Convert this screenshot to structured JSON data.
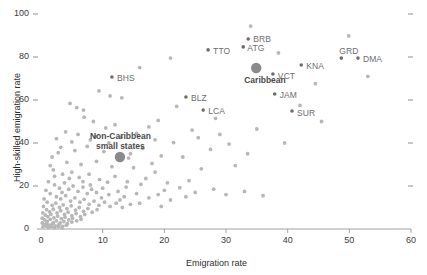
{
  "chart_data": {
    "type": "scatter",
    "title": "",
    "xlabel": "Emigration rate",
    "ylabel": "High-skilled emigration rate",
    "xlim": [
      0,
      60
    ],
    "ylim": [
      0,
      100
    ],
    "xticks": [
      0,
      10,
      20,
      30,
      40,
      50,
      60
    ],
    "yticks": [
      0,
      20,
      40,
      60,
      80,
      100
    ],
    "grid": false,
    "legend": "none",
    "colors": {
      "background_points": "#b7b7b7",
      "labeled_points": "#6d6d6d",
      "aggregate_markers": "#8a8a8a",
      "axis": "#a0a0a0",
      "text": "#4a4a4a"
    },
    "series": [
      {
        "name": "Labeled Caribbean countries",
        "marker": "small-dark",
        "points": [
          {
            "label": "BHS",
            "x": 11.5,
            "y": 70.7,
            "label_dx": 5,
            "label_dy": -4
          },
          {
            "label": "TTO",
            "x": 27.1,
            "y": 83.3,
            "label_dx": 5,
            "label_dy": -4
          },
          {
            "label": "BRB",
            "x": 33.6,
            "y": 88.4,
            "label_dx": 5,
            "label_dy": -5
          },
          {
            "label": "ATG",
            "x": 32.8,
            "y": 84.7,
            "label_dx": 4,
            "label_dy": -4
          },
          {
            "label": "BLZ",
            "x": 23.5,
            "y": 61.4,
            "label_dx": 5,
            "label_dy": -4
          },
          {
            "label": "LCA",
            "x": 26.3,
            "y": 55.3,
            "label_dx": 5,
            "label_dy": -4
          },
          {
            "label": "VCT",
            "x": 37.6,
            "y": 72.1,
            "label_dx": 5,
            "label_dy": -3
          },
          {
            "label": "KNA",
            "x": 42.2,
            "y": 76.3,
            "label_dx": 5,
            "label_dy": -4
          },
          {
            "label": "JAM",
            "x": 37.9,
            "y": 62.8,
            "label_dx": 5,
            "label_dy": -4
          },
          {
            "label": "SUR",
            "x": 40.7,
            "y": 54.9,
            "label_dx": 5,
            "label_dy": -3
          },
          {
            "label": "GRD",
            "x": 48.7,
            "y": 79.5,
            "label_dx": -2,
            "label_dy": -12
          },
          {
            "label": "DMA",
            "x": 51.4,
            "y": 79.5,
            "label_dx": 5,
            "label_dy": -4
          }
        ]
      },
      {
        "name": "Aggregate markers",
        "marker": "large",
        "points": [
          {
            "label": "Caribbean",
            "x": 34.9,
            "y": 74.9,
            "label_dx": -12,
            "label_dy": 7
          },
          {
            "label": "Non-Caribbean small states",
            "x": 12.8,
            "y": 33.5,
            "label_dx": -30,
            "label_dy": -26
          }
        ]
      },
      {
        "name": "Other countries",
        "marker": "small-light",
        "points": [
          {
            "x": 34.0,
            "y": 94.4
          },
          {
            "x": 49.9,
            "y": 89.8
          },
          {
            "x": 21.0,
            "y": 79.5
          },
          {
            "x": 38.5,
            "y": 81.9
          },
          {
            "x": 9.4,
            "y": 64.2
          },
          {
            "x": 16.0,
            "y": 75.1
          },
          {
            "x": 11.2,
            "y": 61.9
          },
          {
            "x": 13.1,
            "y": 61.0
          },
          {
            "x": 53.0,
            "y": 71.0
          },
          {
            "x": 4.7,
            "y": 58.4
          },
          {
            "x": 5.8,
            "y": 56.5
          },
          {
            "x": 6.9,
            "y": 55.3
          },
          {
            "x": 22.0,
            "y": 57.0
          },
          {
            "x": 28.3,
            "y": 51.5
          },
          {
            "x": 44.5,
            "y": 67.6
          },
          {
            "x": 8.5,
            "y": 50.0
          },
          {
            "x": 4.0,
            "y": 45.2
          },
          {
            "x": 10.5,
            "y": 47.0
          },
          {
            "x": 17.5,
            "y": 47.5
          },
          {
            "x": 2.5,
            "y": 42.0
          },
          {
            "x": 6.0,
            "y": 44.0
          },
          {
            "x": 8.8,
            "y": 43.0
          },
          {
            "x": 13.0,
            "y": 42.6
          },
          {
            "x": 18.5,
            "y": 41.5
          },
          {
            "x": 21.5,
            "y": 40.2
          },
          {
            "x": 25.5,
            "y": 42.5
          },
          {
            "x": 30.5,
            "y": 39.5
          },
          {
            "x": 3.2,
            "y": 38.0
          },
          {
            "x": 5.5,
            "y": 36.5
          },
          {
            "x": 7.5,
            "y": 38.4
          },
          {
            "x": 10.2,
            "y": 36.0
          },
          {
            "x": 14.5,
            "y": 35.0
          },
          {
            "x": 16.5,
            "y": 37.5
          },
          {
            "x": 19.5,
            "y": 34.0
          },
          {
            "x": 23.0,
            "y": 33.5
          },
          {
            "x": 1.8,
            "y": 33.5
          },
          {
            "x": 4.2,
            "y": 31.0
          },
          {
            "x": 6.5,
            "y": 30.0
          },
          {
            "x": 9.0,
            "y": 31.5
          },
          {
            "x": 11.5,
            "y": 29.0
          },
          {
            "x": 15.0,
            "y": 28.5
          },
          {
            "x": 18.0,
            "y": 30.5
          },
          {
            "x": 26.0,
            "y": 28.0
          },
          {
            "x": 31.5,
            "y": 29.5
          },
          {
            "x": 2.0,
            "y": 27.5
          },
          {
            "x": 3.5,
            "y": 25.5
          },
          {
            "x": 5.0,
            "y": 26.5
          },
          {
            "x": 6.2,
            "y": 24.0
          },
          {
            "x": 7.8,
            "y": 25.5
          },
          {
            "x": 9.5,
            "y": 23.0
          },
          {
            "x": 12.0,
            "y": 24.5
          },
          {
            "x": 14.0,
            "y": 22.0
          },
          {
            "x": 17.0,
            "y": 23.5
          },
          {
            "x": 20.5,
            "y": 21.5
          },
          {
            "x": 24.0,
            "y": 22.5
          },
          {
            "x": 1.2,
            "y": 22.0
          },
          {
            "x": 2.2,
            "y": 20.5
          },
          {
            "x": 3.0,
            "y": 19.0
          },
          {
            "x": 3.8,
            "y": 21.5
          },
          {
            "x": 4.5,
            "y": 18.5
          },
          {
            "x": 5.2,
            "y": 20.0
          },
          {
            "x": 6.0,
            "y": 17.5
          },
          {
            "x": 6.8,
            "y": 19.5
          },
          {
            "x": 7.5,
            "y": 16.5
          },
          {
            "x": 8.2,
            "y": 18.5
          },
          {
            "x": 9.0,
            "y": 17.0
          },
          {
            "x": 10.0,
            "y": 19.0
          },
          {
            "x": 11.0,
            "y": 16.0
          },
          {
            "x": 12.5,
            "y": 17.5
          },
          {
            "x": 13.5,
            "y": 15.0
          },
          {
            "x": 15.5,
            "y": 16.5
          },
          {
            "x": 17.5,
            "y": 14.5
          },
          {
            "x": 19.0,
            "y": 16.0
          },
          {
            "x": 21.0,
            "y": 13.5
          },
          {
            "x": 23.5,
            "y": 15.0
          },
          {
            "x": 0.8,
            "y": 18.0
          },
          {
            "x": 1.5,
            "y": 16.5
          },
          {
            "x": 2.5,
            "y": 15.0
          },
          {
            "x": 3.2,
            "y": 14.0
          },
          {
            "x": 4.0,
            "y": 15.5
          },
          {
            "x": 4.8,
            "y": 13.0
          },
          {
            "x": 5.5,
            "y": 14.5
          },
          {
            "x": 6.3,
            "y": 12.5
          },
          {
            "x": 7.0,
            "y": 13.8
          },
          {
            "x": 7.8,
            "y": 11.5
          },
          {
            "x": 8.6,
            "y": 13.0
          },
          {
            "x": 9.4,
            "y": 11.0
          },
          {
            "x": 10.3,
            "y": 12.5
          },
          {
            "x": 11.2,
            "y": 10.5
          },
          {
            "x": 12.2,
            "y": 12.0
          },
          {
            "x": 13.2,
            "y": 10.0
          },
          {
            "x": 14.5,
            "y": 11.5
          },
          {
            "x": 0.5,
            "y": 14.0
          },
          {
            "x": 1.0,
            "y": 12.5
          },
          {
            "x": 1.8,
            "y": 11.0
          },
          {
            "x": 2.4,
            "y": 12.0
          },
          {
            "x": 3.0,
            "y": 10.0
          },
          {
            "x": 3.6,
            "y": 11.2
          },
          {
            "x": 4.2,
            "y": 9.5
          },
          {
            "x": 4.9,
            "y": 10.8
          },
          {
            "x": 5.6,
            "y": 8.8
          },
          {
            "x": 6.2,
            "y": 10.0
          },
          {
            "x": 6.9,
            "y": 8.2
          },
          {
            "x": 7.6,
            "y": 9.5
          },
          {
            "x": 8.3,
            "y": 7.8
          },
          {
            "x": 9.1,
            "y": 9.0
          },
          {
            "x": 0.4,
            "y": 10.5
          },
          {
            "x": 0.9,
            "y": 9.0
          },
          {
            "x": 1.4,
            "y": 8.0
          },
          {
            "x": 2.0,
            "y": 9.2
          },
          {
            "x": 2.6,
            "y": 7.5
          },
          {
            "x": 3.2,
            "y": 8.5
          },
          {
            "x": 3.8,
            "y": 6.8
          },
          {
            "x": 4.4,
            "y": 7.8
          },
          {
            "x": 5.0,
            "y": 6.2
          },
          {
            "x": 5.7,
            "y": 7.2
          },
          {
            "x": 6.4,
            "y": 5.8
          },
          {
            "x": 7.1,
            "y": 6.8
          },
          {
            "x": 0.3,
            "y": 7.5
          },
          {
            "x": 0.7,
            "y": 6.5
          },
          {
            "x": 1.1,
            "y": 5.8
          },
          {
            "x": 1.6,
            "y": 6.8
          },
          {
            "x": 2.1,
            "y": 5.2
          },
          {
            "x": 2.7,
            "y": 6.0
          },
          {
            "x": 3.3,
            "y": 4.8
          },
          {
            "x": 3.9,
            "y": 5.5
          },
          {
            "x": 4.5,
            "y": 4.2
          },
          {
            "x": 5.1,
            "y": 5.0
          },
          {
            "x": 5.8,
            "y": 3.8
          },
          {
            "x": 6.5,
            "y": 4.5
          },
          {
            "x": 0.2,
            "y": 5.0
          },
          {
            "x": 0.6,
            "y": 4.2
          },
          {
            "x": 1.0,
            "y": 3.5
          },
          {
            "x": 1.5,
            "y": 4.5
          },
          {
            "x": 2.0,
            "y": 3.0
          },
          {
            "x": 2.5,
            "y": 3.8
          },
          {
            "x": 3.1,
            "y": 2.8
          },
          {
            "x": 3.7,
            "y": 3.5
          },
          {
            "x": 4.3,
            "y": 2.5
          },
          {
            "x": 5.0,
            "y": 3.2
          },
          {
            "x": 0.2,
            "y": 2.8
          },
          {
            "x": 0.5,
            "y": 2.0
          },
          {
            "x": 0.9,
            "y": 2.5
          },
          {
            "x": 1.3,
            "y": 1.8
          },
          {
            "x": 1.8,
            "y": 2.2
          },
          {
            "x": 2.3,
            "y": 1.5
          },
          {
            "x": 2.9,
            "y": 2.0
          },
          {
            "x": 3.5,
            "y": 1.2
          },
          {
            "x": 4.1,
            "y": 1.8
          },
          {
            "x": 0.3,
            "y": 1.0
          },
          {
            "x": 0.8,
            "y": 1.4
          },
          {
            "x": 1.2,
            "y": 0.8
          },
          {
            "x": 1.7,
            "y": 1.1
          },
          {
            "x": 2.2,
            "y": 0.6
          },
          {
            "x": 2.8,
            "y": 1.0
          },
          {
            "x": 3.4,
            "y": 0.5
          },
          {
            "x": 8.0,
            "y": 20.5
          },
          {
            "x": 10.8,
            "y": 21.8
          },
          {
            "x": 13.8,
            "y": 19.5
          },
          {
            "x": 16.2,
            "y": 20.8
          },
          {
            "x": 20.0,
            "y": 18.0
          },
          {
            "x": 22.5,
            "y": 19.2
          },
          {
            "x": 25.0,
            "y": 17.0
          },
          {
            "x": 28.0,
            "y": 18.5
          },
          {
            "x": 30.0,
            "y": 16.0
          },
          {
            "x": 33.0,
            "y": 17.5
          },
          {
            "x": 36.0,
            "y": 15.5
          },
          {
            "x": 15.5,
            "y": 44.5
          },
          {
            "x": 12.0,
            "y": 48.5
          },
          {
            "x": 19.0,
            "y": 50.5
          },
          {
            "x": 7.0,
            "y": 52.0
          },
          {
            "x": 24.5,
            "y": 46.0
          },
          {
            "x": 29.0,
            "y": 44.0
          },
          {
            "x": 35.0,
            "y": 46.5
          },
          {
            "x": 42.0,
            "y": 57.5
          },
          {
            "x": 45.5,
            "y": 50.0
          },
          {
            "x": 39.5,
            "y": 40.0
          },
          {
            "x": 27.5,
            "y": 37.0
          },
          {
            "x": 33.5,
            "y": 35.0
          },
          {
            "x": 11.0,
            "y": 40.0
          },
          {
            "x": 8.0,
            "y": 41.5
          },
          {
            "x": 14.2,
            "y": 33.0
          },
          {
            "x": 5.0,
            "y": 40.5
          },
          {
            "x": 2.8,
            "y": 35.5
          },
          {
            "x": 1.5,
            "y": 29.5
          },
          {
            "x": 18.5,
            "y": 26.5
          },
          {
            "x": 16.0,
            "y": 12.0
          },
          {
            "x": 19.5,
            "y": 10.5
          },
          {
            "x": 6.8,
            "y": 22.0
          },
          {
            "x": 9.8,
            "y": 14.5
          },
          {
            "x": 12.8,
            "y": 13.5
          },
          {
            "x": 4.6,
            "y": 23.5
          },
          {
            "x": 3.4,
            "y": 17.0
          },
          {
            "x": 2.2,
            "y": 24.5
          }
        ]
      }
    ]
  }
}
